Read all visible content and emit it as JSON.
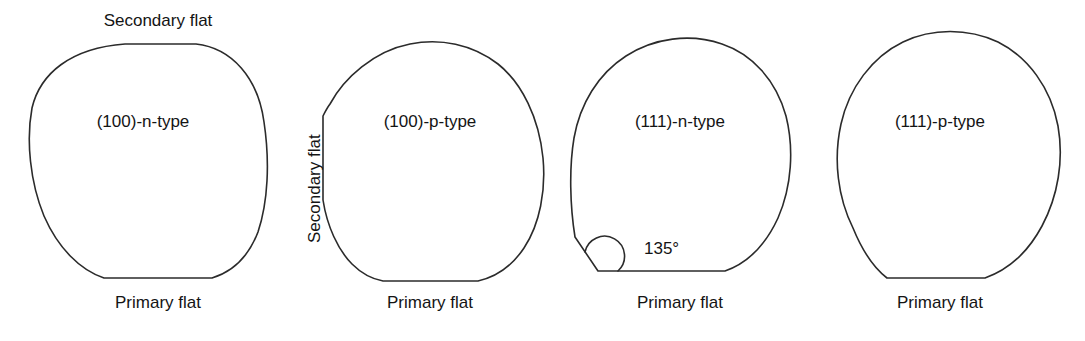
{
  "figure": {
    "background_color": "#ffffff",
    "line_color": "#2b2b2b",
    "text_color": "#141414",
    "width": 1085,
    "height": 341
  },
  "labels": {
    "secondary_flat_top": "Secondary flat",
    "secondary_flat_side": "Secondary flat",
    "angle_135": "135°"
  },
  "wafers": [
    {
      "id": "wafer-100-n-type",
      "name": "(100)-n-type",
      "primary_flat_label": "Primary flat",
      "secondary_flat_label": "Secondary flat",
      "secondary_flat_position": "top",
      "secondary_flat_angle": "180°",
      "name_x": 143,
      "name_y": 122,
      "primary_label_x": 158,
      "primary_label_y": 305
    },
    {
      "id": "wafer-100-p-type",
      "name": "(100)-p-type",
      "primary_flat_label": "Primary flat",
      "secondary_flat_label": "Secondary flat",
      "secondary_flat_position": "left",
      "secondary_flat_angle": "90°",
      "name_x": 430,
      "name_y": 122,
      "primary_label_x": 430,
      "primary_label_y": 305
    },
    {
      "id": "wafer-111-n-type",
      "name": "(111)-n-type",
      "primary_flat_label": "Primary flat",
      "secondary_flat_position": "lower-left",
      "secondary_flat_angle": "135°",
      "angle_annotation": "135°",
      "name_x": 680,
      "name_y": 122,
      "primary_label_x": 680,
      "primary_label_y": 305
    },
    {
      "id": "wafer-111-p-type",
      "name": "(111)-p-type",
      "primary_flat_label": "Primary flat",
      "secondary_flat_position": "none",
      "name_x": 940,
      "name_y": 122,
      "primary_label_x": 940,
      "primary_label_y": 305
    }
  ]
}
